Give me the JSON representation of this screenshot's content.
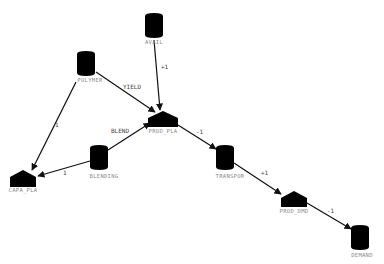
{
  "diagram": {
    "type": "network-flow-model",
    "nodes": [
      {
        "id": "AVAIL",
        "label": "AVAIL",
        "shape": "cylinder",
        "x": 154,
        "y": 25
      },
      {
        "id": "POLYMER",
        "label": "POLYMER",
        "shape": "cylinder",
        "x": 86,
        "y": 63
      },
      {
        "id": "PROD_PLA",
        "label": "PROD_PLA",
        "shape": "house",
        "x": 163,
        "y": 119
      },
      {
        "id": "CAPA_PLA",
        "label": "CAPA_PLA",
        "shape": "house",
        "x": 23,
        "y": 178
      },
      {
        "id": "BLENDING",
        "label": "BLENDING",
        "shape": "cylinder",
        "x": 99,
        "y": 158
      },
      {
        "id": "TRANSPOR",
        "label": "TRANSPOR",
        "shape": "cylinder",
        "x": 225,
        "y": 158
      },
      {
        "id": "PROD_DMD",
        "label": "PROD_DMD",
        "shape": "house",
        "x": 294,
        "y": 199
      },
      {
        "id": "DEMAND",
        "label": "DEMAND",
        "shape": "cylinder",
        "x": 360,
        "y": 238
      }
    ],
    "edges": [
      {
        "from": "AVAIL",
        "to": "PROD_PLA",
        "label": "+1"
      },
      {
        "from": "POLYMER",
        "to": "PROD_PLA",
        "label": "YIELD"
      },
      {
        "from": "POLYMER",
        "to": "CAPA_PLA",
        "label": "1"
      },
      {
        "from": "BLENDING",
        "to": "PROD_PLA",
        "label": "BLEND"
      },
      {
        "from": "BLENDING",
        "to": "CAPA_PLA",
        "label": "1"
      },
      {
        "from": "PROD_PLA",
        "to": "TRANSPOR",
        "label": "-1"
      },
      {
        "from": "TRANSPOR",
        "to": "PROD_DMD",
        "label": "+1"
      },
      {
        "from": "PROD_DMD",
        "to": "DEMAND",
        "label": "-1"
      }
    ]
  },
  "colors": {
    "node_fill": "#000000",
    "edge": "#111111",
    "node_label": "#8a8a8a",
    "edge_label": "#444444",
    "background": "#ffffff"
  }
}
